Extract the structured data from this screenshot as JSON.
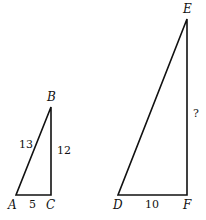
{
  "diagram": {
    "triangles": [
      {
        "name": "ABC",
        "vertices": {
          "A": "A",
          "B": "B",
          "C": "C"
        },
        "sides": {
          "AB": "13",
          "BC": "12",
          "AC": "5"
        },
        "right_angle_at": "C"
      },
      {
        "name": "DEF",
        "vertices": {
          "D": "D",
          "E": "E",
          "F": "F"
        },
        "sides": {
          "DF": "10",
          "EF": "?"
        },
        "right_angle_at": "F"
      }
    ],
    "stroke_color": "#111111"
  }
}
